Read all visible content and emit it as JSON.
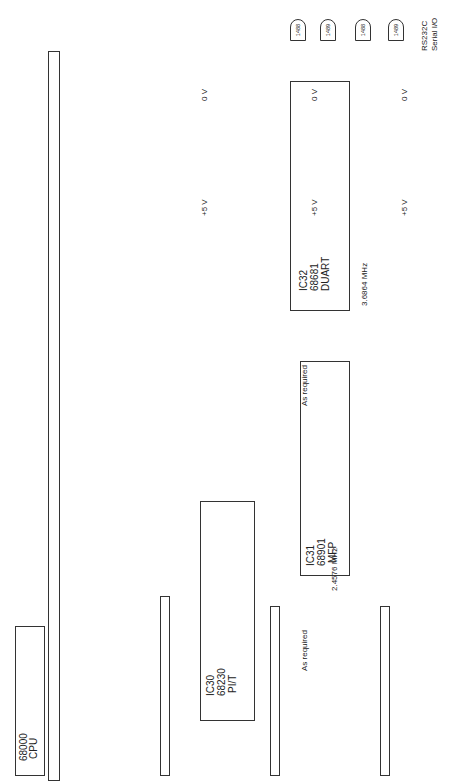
{
  "figure": {
    "type": "circuit schematic",
    "orientation": "rotated 90 degrees counter-clockwise"
  },
  "cpu": {
    "name": "68000",
    "sub": "CPU",
    "pins": [
      {
        "label": "D00",
        "num": "5"
      },
      {
        "label": "D01",
        "num": "4"
      },
      {
        "label": "D02",
        "num": "3"
      },
      {
        "label": "D03",
        "num": "2"
      },
      {
        "label": "D04",
        "num": "1"
      },
      {
        "label": "D05",
        "num": "64"
      },
      {
        "label": "D06",
        "num": "63"
      },
      {
        "label": "D07",
        "num": "62"
      },
      {
        "label": "D0?",
        "num": "29"
      },
      {
        "label": "A01",
        "num": "30"
      },
      {
        "label": "A02",
        "num": "31"
      },
      {
        "label": "A03",
        "num": "32"
      },
      {
        "label": "A04",
        "num": "33"
      },
      {
        "label": "A05",
        "num": "15"
      },
      {
        "label": "CLK",
        "num": "18"
      },
      {
        "label": "RESET*",
        "num": "9"
      },
      {
        "label": "R/W*",
        "num": "10"
      },
      {
        "label": "DTACK*",
        "num": "8"
      },
      {
        "label": "LDS*",
        "num": ""
      }
    ]
  },
  "ic30": {
    "name": "IC30",
    "part": "68230",
    "func": "PI/T",
    "vcc": {
      "label": "Vcc",
      "pin": "12",
      "rail": "+5 V"
    },
    "vss": {
      "label": "Vss",
      "pin": "38",
      "rail": "0 V"
    },
    "bus_pins": [
      {
        "label": "D00",
        "num": "44"
      },
      {
        "label": "D01",
        "num": "45"
      },
      {
        "label": "D02",
        "num": "46"
      },
      {
        "label": "D03",
        "num": "47"
      },
      {
        "label": "D04",
        "num": "48"
      },
      {
        "label": "D05",
        "num": "1"
      },
      {
        "label": "D06",
        "num": "2"
      },
      {
        "label": "D07",
        "num": "3"
      },
      {
        "label": "RS1",
        "num": "29",
        "addr": "A01"
      },
      {
        "label": "RS2",
        "num": "28",
        "addr": "A02"
      },
      {
        "label": "RS3",
        "num": "27",
        "addr": "A03"
      },
      {
        "label": "RS4",
        "num": "26",
        "addr": "A04"
      },
      {
        "label": "RS5",
        "num": "25",
        "addr": "A05"
      },
      {
        "label": "CLK",
        "num": "40"
      },
      {
        "label": "RESET*",
        "num": "39"
      },
      {
        "label": "R/W*",
        "num": "43"
      },
      {
        "label": "DTACK*",
        "num": "42"
      },
      {
        "label": "CS*",
        "num": "41",
        "net": "CS_P1*"
      }
    ],
    "port_pins": [
      {
        "label": "PA0",
        "num": "4"
      },
      {
        "label": "PA1",
        "num": "5"
      },
      {
        "label": "PA2",
        "num": "6"
      },
      {
        "label": "PA3",
        "num": "7"
      },
      {
        "label": "PA4",
        "num": "8"
      },
      {
        "label": "PA5",
        "num": "9"
      },
      {
        "label": "PA6",
        "num": "10"
      },
      {
        "label": "PA7",
        "num": "11"
      },
      {
        "label": "H1",
        "num": "13"
      },
      {
        "label": "H2",
        "num": "14"
      },
      {
        "label": "H3",
        "num": "15"
      },
      {
        "label": "H4",
        "num": "16"
      },
      {
        "label": "PB0",
        "num": "17"
      },
      {
        "label": "PB1",
        "num": "18"
      },
      {
        "label": "PB2",
        "num": "19"
      },
      {
        "label": "PB3",
        "num": "20"
      },
      {
        "label": "PB4",
        "num": "21"
      },
      {
        "label": "PB5",
        "num": "22"
      },
      {
        "label": "PB6",
        "num": "23"
      },
      {
        "label": "PB7",
        "num": "24"
      },
      {
        "label": "PC0",
        "num": "30"
      },
      {
        "label": "PC1",
        "num": "31"
      },
      {
        "label": "PC2/TIN",
        "num": "32"
      },
      {
        "label": "PC3/TOUT",
        "num": "33"
      },
      {
        "label": "PC4/DMAREQ*",
        "num": "34"
      },
      {
        "label": "PC5/PIRQ*",
        "num": "35"
      },
      {
        "label": "PC6/PIACK*",
        "num": "36"
      },
      {
        "label": "PC7/TIACK*",
        "num": "37"
      }
    ]
  },
  "ic31": {
    "name": "IC31",
    "part": "68901",
    "func": "MFP",
    "vcc": {
      "label": "Vcc",
      "pin": "11",
      "rail": "+5 V"
    },
    "vss": {
      "label": "Vss",
      "pin": "36",
      "rail": "0 V"
    },
    "bus_pins": [
      {
        "label": "D00",
        "num": "37"
      },
      {
        "label": "D01",
        "num": "38"
      },
      {
        "label": "D02",
        "num": "39"
      },
      {
        "label": "D03",
        "num": "40"
      },
      {
        "label": "D04",
        "num": "41"
      },
      {
        "label": "D05",
        "num": "42"
      },
      {
        "label": "D06",
        "num": "43"
      },
      {
        "label": "D07",
        "num": "44"
      },
      {
        "label": "RS1",
        "num": "2",
        "addr": "A01"
      },
      {
        "label": "RS2",
        "num": "3",
        "addr": "A02"
      },
      {
        "label": "RS3",
        "num": "4",
        "addr": "A03"
      },
      {
        "label": "RS4",
        "num": "5",
        "addr": "A04"
      },
      {
        "label": "RS5",
        "num": "6",
        "addr": "A05"
      },
      {
        "label": "CLK",
        "num": "35",
        "note": "4 MHz"
      },
      {
        "label": "RESET*",
        "num": "21"
      },
      {
        "label": "R/W*",
        "num": "1"
      },
      {
        "label": "DTACK*",
        "num": "46"
      },
      {
        "label": "DS*",
        "num": "47",
        "net": "LDS*"
      },
      {
        "label": "CS*",
        "num": "48",
        "net": "CS_P2*"
      }
    ],
    "io_pins": [
      {
        "label": "I0",
        "num": "22"
      },
      {
        "label": "I1",
        "num": "23"
      },
      {
        "label": "I2",
        "num": "24"
      },
      {
        "label": "I3",
        "num": "25"
      },
      {
        "label": "I4",
        "num": "26"
      },
      {
        "label": "I5",
        "num": "27"
      },
      {
        "label": "I6",
        "num": "28"
      },
      {
        "label": "I7",
        "num": "29"
      },
      {
        "label": "TAI",
        "num": "19"
      },
      {
        "label": "TBI",
        "num": "20"
      },
      {
        "label": "TAO",
        "num": "13"
      },
      {
        "label": "TBO",
        "num": "14"
      },
      {
        "label": "TCO",
        "num": "15"
      },
      {
        "label": "TDO",
        "num": "16"
      },
      {
        "label": "RC",
        "num": "10"
      },
      {
        "label": "SI",
        "num": "9"
      },
      {
        "label": "TC",
        "num": "7"
      },
      {
        "label": "SO",
        "num": "8"
      },
      {
        "label": "TR*",
        "num": "30"
      },
      {
        "label": "RR*",
        "num": "31"
      }
    ],
    "irq": [
      {
        "label": "IRQ*",
        "num": "32"
      },
      {
        "label": "IACK*",
        "num": "45"
      }
    ],
    "xtal": [
      {
        "label": "XTAL1",
        "num": "17"
      },
      {
        "label": "XTAL2",
        "num": "18"
      }
    ],
    "iei": {
      "label": "IEI*",
      "num": "34",
      "net": "0 V"
    },
    "ieo": {
      "label": "IEO*",
      "num": "39",
      "net": "NC"
    },
    "crystal": "2.4576 MHz",
    "caps": [
      "27 pF",
      "27 pF"
    ],
    "note": "As required"
  },
  "ic32": {
    "name": "IC32",
    "part": "68681",
    "func": "DUART",
    "vcc": {
      "label": "Vcc",
      "pin": "40",
      "rail": "+5 V"
    },
    "vss": {
      "label": "Vss",
      "pin": "20",
      "rail": "0 V"
    },
    "bus_pins": [
      {
        "label": "D00",
        "num": "25"
      },
      {
        "label": "D01",
        "num": "16"
      },
      {
        "label": "D02",
        "num": "26"
      },
      {
        "label": "D03",
        "num": "17"
      },
      {
        "label": "D04",
        "num": "23"
      },
      {
        "label": "D05",
        "num": "18"
      },
      {
        "label": "D06",
        "num": "22"
      },
      {
        "label": "D07",
        "num": "19"
      },
      {
        "label": "RS1",
        "num": "1",
        "addr": "A01"
      },
      {
        "label": "RS2",
        "num": "3",
        "addr": "A02"
      },
      {
        "label": "RS3",
        "num": "5",
        "addr": "A03"
      },
      {
        "label": "RS4",
        "num": "6",
        "addr": "A04"
      },
      {
        "label": "RESET*",
        "num": "34"
      },
      {
        "label": "R/W*",
        "num": "8"
      },
      {
        "label": "DTACK*",
        "num": "9"
      },
      {
        "label": "CS*",
        "num": "35",
        "net": "CS_P3*"
      }
    ],
    "io_pins": [
      {
        "label": "TxDA",
        "num": "30"
      },
      {
        "label": "RxDA",
        "num": "31"
      },
      {
        "label": "TxDB",
        "num": "11"
      },
      {
        "label": "RxDB",
        "num": "10"
      },
      {
        "label": "IP0",
        "num": "7"
      },
      {
        "label": "IP1",
        "num": "4"
      },
      {
        "label": "IP2",
        "num": "36"
      },
      {
        "label": "IP3",
        "num": "2"
      },
      {
        "label": "IP4",
        "num": "39"
      },
      {
        "label": "IP5",
        "num": "38"
      },
      {
        "label": "OP0",
        "num": "29"
      },
      {
        "label": "OP1",
        "num": "12"
      },
      {
        "label": "OP2",
        "num": "28"
      },
      {
        "label": "OP3",
        "num": "13"
      },
      {
        "label": "OP4",
        "num": "27"
      },
      {
        "label": "OP5",
        "num": "14"
      },
      {
        "label": "OP6",
        "num": "26"
      },
      {
        "label": "OP7",
        "num": "15"
      }
    ],
    "irq": [
      {
        "label": "IRQ*",
        "num": "21"
      },
      {
        "label": "IACK*",
        "num": "37"
      }
    ],
    "xtal": [
      {
        "label": "X1",
        "num": "32"
      },
      {
        "label": "X2",
        "num": "33"
      }
    ],
    "crystal": "3.6864 MHz",
    "caps": [
      "15 pF",
      "5 pF"
    ],
    "note": "As required"
  },
  "line_drivers": [
    {
      "part": "1488",
      "in_pin": "2",
      "out_pin": "3",
      "signal": "TxDA"
    },
    {
      "part": "1489",
      "in_pin": "1",
      "out_pin": "3",
      "signal": "RxDA"
    },
    {
      "part": "1488",
      "in_pin": "4",
      "in2_pin": "5",
      "out_pin": "6",
      "signal": "TxDB",
      "supply": "+5 V"
    },
    {
      "part": "1489",
      "in_pin": "4",
      "out_pin": "6",
      "signal": "RxDB"
    }
  ],
  "rs232": {
    "label": "RS232C",
    "sub": "Serial I/O"
  },
  "rails": {
    "vcc": "+5 V",
    "gnd": "0 V"
  }
}
